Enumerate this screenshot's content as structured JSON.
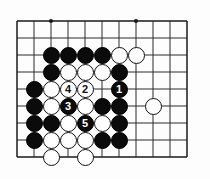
{
  "diagram": {
    "kind": "go-board-diagram",
    "board": {
      "cols": 11,
      "rows": 9,
      "origin_x": 17,
      "origin_y": 21,
      "spacing": 17,
      "line_color": "#2b2b2b",
      "edge_line_color": "#1a1a1a",
      "background": "#fdfdfd",
      "stone_radius": 8.5
    },
    "star_points": [
      {
        "col": 3,
        "row": 1
      },
      {
        "col": 8,
        "row": 1
      }
    ],
    "colors": {
      "black_stone": "#0b0b0b",
      "white_stone": "#ffffff",
      "black_label": "#ffffff",
      "white_label": "#111111"
    },
    "stones": [
      {
        "col": 3,
        "row": 3,
        "color": "black",
        "label": ""
      },
      {
        "col": 4,
        "row": 3,
        "color": "black",
        "label": ""
      },
      {
        "col": 5,
        "row": 3,
        "color": "black",
        "label": ""
      },
      {
        "col": 6,
        "row": 3,
        "color": "black",
        "label": ""
      },
      {
        "col": 7,
        "row": 3,
        "color": "white",
        "label": ""
      },
      {
        "col": 8,
        "row": 3,
        "color": "white",
        "label": ""
      },
      {
        "col": 3,
        "row": 4,
        "color": "black",
        "label": ""
      },
      {
        "col": 4,
        "row": 4,
        "color": "white",
        "label": ""
      },
      {
        "col": 5,
        "row": 4,
        "color": "white",
        "label": ""
      },
      {
        "col": 6,
        "row": 4,
        "color": "white",
        "label": ""
      },
      {
        "col": 7,
        "row": 4,
        "color": "black",
        "label": ""
      },
      {
        "col": 2,
        "row": 5,
        "color": "black",
        "label": ""
      },
      {
        "col": 3,
        "row": 5,
        "color": "white",
        "label": ""
      },
      {
        "col": 4,
        "row": 5,
        "color": "white",
        "label": "4"
      },
      {
        "col": 5,
        "row": 5,
        "color": "white",
        "label": "2"
      },
      {
        "col": 7,
        "row": 5,
        "color": "black",
        "label": "1"
      },
      {
        "col": 2,
        "row": 6,
        "color": "black",
        "label": ""
      },
      {
        "col": 3,
        "row": 6,
        "color": "white",
        "label": ""
      },
      {
        "col": 4,
        "row": 6,
        "color": "black",
        "label": "3"
      },
      {
        "col": 5,
        "row": 6,
        "color": "white",
        "label": ""
      },
      {
        "col": 6,
        "row": 6,
        "color": "black",
        "label": ""
      },
      {
        "col": 7,
        "row": 6,
        "color": "black",
        "label": ""
      },
      {
        "col": 9,
        "row": 6,
        "color": "white",
        "label": ""
      },
      {
        "col": 2,
        "row": 7,
        "color": "black",
        "label": ""
      },
      {
        "col": 3,
        "row": 7,
        "color": "black",
        "label": ""
      },
      {
        "col": 4,
        "row": 7,
        "color": "white",
        "label": ""
      },
      {
        "col": 5,
        "row": 7,
        "color": "black",
        "label": "5"
      },
      {
        "col": 6,
        "row": 7,
        "color": "white",
        "label": ""
      },
      {
        "col": 7,
        "row": 7,
        "color": "black",
        "label": ""
      },
      {
        "col": 2,
        "row": 8,
        "color": "black",
        "label": ""
      },
      {
        "col": 3,
        "row": 8,
        "color": "white",
        "label": ""
      },
      {
        "col": 4,
        "row": 8,
        "color": "white",
        "label": ""
      },
      {
        "col": 5,
        "row": 8,
        "color": "white",
        "label": ""
      },
      {
        "col": 6,
        "row": 8,
        "color": "black",
        "label": ""
      },
      {
        "col": 7,
        "row": 8,
        "color": "black",
        "label": ""
      },
      {
        "col": 3,
        "row": 9,
        "color": "white",
        "label": ""
      },
      {
        "col": 5,
        "row": 9,
        "color": "white",
        "label": ""
      }
    ],
    "move_sequence": [
      {
        "number": "1",
        "color": "black"
      },
      {
        "number": "2",
        "color": "white"
      },
      {
        "number": "3",
        "color": "black"
      },
      {
        "number": "4",
        "color": "white"
      },
      {
        "number": "5",
        "color": "black"
      }
    ]
  }
}
